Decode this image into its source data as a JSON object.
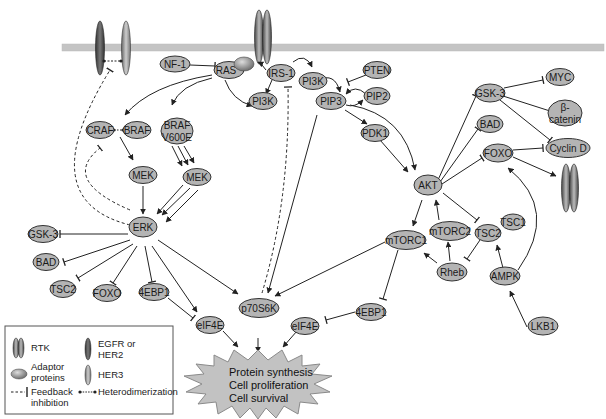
{
  "colors": {
    "node_fill": "#b4b4b4",
    "node_stroke": "#333333",
    "membrane": "#c4c4c4",
    "burst_fill": "#c2c2c2",
    "burst_stroke": "#8a8a8a",
    "line": "#222222"
  },
  "nodes": {
    "nf1": "NF-1",
    "ras": "RAS",
    "irs1": "IRS-1",
    "pi3k_a": "PI3K",
    "pi3k_b": "PI3K",
    "pten": "PTEN",
    "pip3": "PIP3",
    "pip2": "PIP2",
    "pdk1": "PDK1",
    "craf": "CRAF",
    "braf": "BRAF",
    "braf_v600e_1": "BRAF",
    "braf_v600e_2": "V600E",
    "mek_a": "MEK",
    "mek_b": "MEK",
    "erk": "ERK",
    "gsk3_left": "GSK-3",
    "bad_left": "BAD",
    "tsc2_left": "TSC2",
    "foxo_left": "FOXO",
    "4ebp1_left": "4EBP1",
    "eif4e_left": "eIF4E",
    "p70s6k": "p70S6K",
    "eif4e_right": "eIF4E",
    "4ebp1_right": "4EBP1",
    "akt": "AKT",
    "mtorc1": "mTORC1",
    "mtorc2": "mTORC2",
    "tsc1": "TSC1",
    "tsc2_right": "TSC2",
    "rheb": "Rheb",
    "ampk": "AMPK",
    "lkb1": "LKB1",
    "gsk3_right": "GSK-3",
    "myc": "MYC",
    "beta_catenin_1": "β-",
    "beta_catenin_2": "catenin",
    "bad_right": "BAD",
    "foxo_right": "FOXO",
    "cyclin_d": "Cyclin D"
  },
  "outcome": {
    "line1": "Protein synthesis",
    "line2": "Cell proliferation",
    "line3": "Cell survival"
  },
  "legend": {
    "rtk": "RTK",
    "adaptor_1": "Adaptor",
    "adaptor_2": "proteins",
    "egfr_1": "EGFR or",
    "egfr_2": "HER2",
    "her3": "HER3",
    "feedback_1": "Feedback",
    "feedback_2": "inhibition",
    "heterodimerization": "Heterodimerization"
  }
}
